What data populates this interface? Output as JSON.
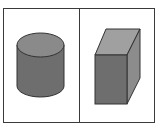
{
  "figure": {
    "panels": [
      {
        "shape": "cylinder",
        "label": ""
      },
      {
        "shape": "rectangular-prism",
        "label": ""
      }
    ],
    "colors": {
      "frame": "#3a3a3a",
      "cylinder_top": "#8a8a8a",
      "cylinder_side": "#6e6e6e",
      "prism_top": "#a0a0a0",
      "prism_front": "#6e6e6e",
      "prism_side": "#8c8c8c",
      "outline": "#333333"
    }
  }
}
